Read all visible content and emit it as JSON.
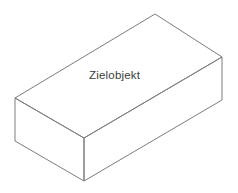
{
  "diagram": {
    "type": "isometric-cuboid",
    "label": "Zielobjekt",
    "background_color": "#ffffff",
    "edge_color": "#7d7d7d",
    "face_color": "#ffffff",
    "label_color": "#3b3b3b",
    "edge_width": 1,
    "canvas": {
      "width": 238,
      "height": 193
    },
    "vertices": {
      "top_back": [
        155,
        14
      ],
      "top_left": [
        15,
        98
      ],
      "top_right": [
        222,
        57
      ],
      "top_front": [
        84,
        138
      ],
      "bottom_left": [
        15,
        141
      ],
      "bottom_right": [
        222,
        100
      ],
      "bottom_front": [
        84,
        181
      ]
    },
    "faces": {
      "top": "155,14 222,57 84,138 15,98",
      "left_front": "15,98 84,138 84,181 15,141",
      "right_front": "84,138 222,57 222,100 84,181"
    },
    "label_position": {
      "x": 115,
      "y": 78
    }
  }
}
